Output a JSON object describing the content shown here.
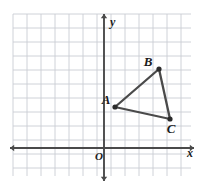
{
  "figure": {
    "background_color": "#ffffff",
    "width": 203,
    "height": 187
  },
  "grid": {
    "visible": true,
    "line_color": "#c9cdd4",
    "cell_size_px": 14,
    "left_px": 13,
    "top_px": 14,
    "right_px": 191,
    "bottom_px": 176,
    "columns": 13,
    "rows": 12
  },
  "axes": {
    "color": "#4a4a4a",
    "x_axis": {
      "label": "x",
      "label_x": 187,
      "label_y": 157,
      "y_px": 148,
      "start_px": 10,
      "end_px": 194
    },
    "y_axis": {
      "label": "y",
      "label_x": 110,
      "label_y": 26,
      "x_px": 104,
      "start_px": 14,
      "end_px": 181
    },
    "origin": {
      "label": "O",
      "label_x": 95,
      "label_y": 160,
      "x_px": 104,
      "y_px": 148
    }
  },
  "chart_data": {
    "type": "scatter",
    "xlabel": "x",
    "ylabel": "y",
    "grid": true,
    "legend": "none",
    "xlim": [
      -6.5,
      6.2
    ],
    "ylim": [
      -2.0,
      9.6
    ],
    "points": [
      {
        "name": "A",
        "x": 1,
        "y": 3,
        "px": 115,
        "py": 107,
        "label_px": 106,
        "label_py": 104
      },
      {
        "name": "B",
        "x": 4,
        "y": 6,
        "px": 159,
        "py": 69,
        "label_px": 148,
        "label_py": 66
      },
      {
        "name": "C",
        "x": 5,
        "y": 2,
        "px": 170,
        "py": 119,
        "label_px": 171,
        "label_py": 133
      }
    ],
    "edges": [
      {
        "from": "A",
        "to": "B"
      },
      {
        "from": "B",
        "to": "C"
      },
      {
        "from": "C",
        "to": "A"
      }
    ],
    "shape_outline_color": "#4a4a4a",
    "point_color": "#2b2b2b"
  }
}
